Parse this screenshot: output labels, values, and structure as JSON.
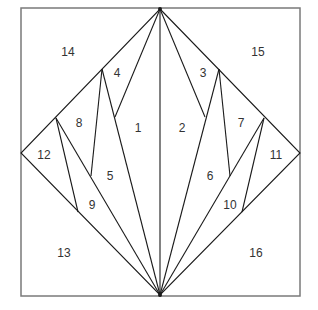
{
  "diagram": {
    "title": "",
    "colors": {
      "frame": "#7a7a7a",
      "line": "#1a1a1a",
      "label": "#333333",
      "background": "#ffffff"
    },
    "frame": {
      "x1": 21,
      "y1": 8,
      "x2": 300,
      "y2": 296
    },
    "diamond": {
      "top": [
        160,
        9
      ],
      "right": [
        300,
        153
      ],
      "bottom": [
        160,
        295
      ],
      "left": [
        21,
        153
      ]
    },
    "segments": [
      {
        "id": "center",
        "from": [
          160,
          9
        ],
        "to": [
          160,
          295
        ]
      },
      {
        "id": "l1",
        "from": [
          160,
          9
        ],
        "to": [
          115,
          117
        ]
      },
      {
        "id": "l2",
        "from": [
          102,
          69
        ],
        "to": [
          160,
          295
        ]
      },
      {
        "id": "l3",
        "from": [
          102,
          69
        ],
        "to": [
          91,
          176
        ]
      },
      {
        "id": "l4",
        "from": [
          56,
          118
        ],
        "to": [
          160,
          295
        ]
      },
      {
        "id": "l5",
        "from": [
          56,
          118
        ],
        "to": [
          78,
          212
        ]
      },
      {
        "id": "r1",
        "from": [
          160,
          9
        ],
        "to": [
          205,
          117
        ]
      },
      {
        "id": "r2",
        "from": [
          219,
          69
        ],
        "to": [
          160,
          295
        ]
      },
      {
        "id": "r3",
        "from": [
          219,
          69
        ],
        "to": [
          230,
          176
        ]
      },
      {
        "id": "r4",
        "from": [
          264,
          118
        ],
        "to": [
          160,
          295
        ]
      },
      {
        "id": "r5",
        "from": [
          264,
          118
        ],
        "to": [
          242,
          212
        ]
      }
    ],
    "pieces": [
      {
        "label": "1",
        "x": 138,
        "y": 132
      },
      {
        "label": "2",
        "x": 182,
        "y": 132
      },
      {
        "label": "3",
        "x": 203,
        "y": 77
      },
      {
        "label": "4",
        "x": 117,
        "y": 77
      },
      {
        "label": "5",
        "x": 110,
        "y": 180
      },
      {
        "label": "6",
        "x": 210,
        "y": 180
      },
      {
        "label": "7",
        "x": 241,
        "y": 127
      },
      {
        "label": "8",
        "x": 79,
        "y": 127
      },
      {
        "label": "9",
        "x": 92,
        "y": 209
      },
      {
        "label": "10",
        "x": 230,
        "y": 209
      },
      {
        "label": "11",
        "x": 276,
        "y": 159
      },
      {
        "label": "12",
        "x": 44,
        "y": 159
      },
      {
        "label": "13",
        "x": 64,
        "y": 257
      },
      {
        "label": "14",
        "x": 68,
        "y": 56
      },
      {
        "label": "15",
        "x": 258,
        "y": 56
      },
      {
        "label": "16",
        "x": 256,
        "y": 257
      }
    ]
  }
}
